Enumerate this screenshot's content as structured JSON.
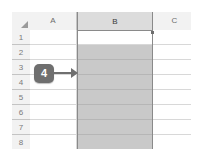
{
  "app": {
    "type": "spreadsheet",
    "name": "Excel worksheet grid"
  },
  "grid": {
    "select_all_corner": "select-all",
    "column_headers": [
      {
        "label": "A",
        "selected": false
      },
      {
        "label": "B",
        "selected": true
      },
      {
        "label": "C",
        "selected": false
      }
    ],
    "row_headers": [
      {
        "label": "1"
      },
      {
        "label": "2"
      },
      {
        "label": "3"
      },
      {
        "label": "4"
      },
      {
        "label": "5"
      },
      {
        "label": "6"
      },
      {
        "label": "7"
      },
      {
        "label": "8"
      }
    ],
    "cells": {
      "A": [
        "",
        "",
        "",
        "",
        "",
        "",
        "",
        ""
      ],
      "B": [
        "",
        "",
        "",
        "",
        "",
        "",
        "",
        ""
      ],
      "C": [
        "",
        "",
        "",
        "",
        "",
        "",
        "",
        ""
      ]
    },
    "active_cell": "B1",
    "selected_column": "B",
    "selected_range": "B1:B8"
  },
  "annotation": {
    "step_number": "4",
    "arrow_direction": "right",
    "points_to": "B"
  },
  "colors": {
    "header_fill": "#f2f2f2",
    "header_selected_fill": "#dcdcdc",
    "selection_shading": "#c9c9c9",
    "selection_border": "#8a8a8a",
    "gridline": "#d8d8d8",
    "callout_fill": "#6f6f6f",
    "callout_text": "#ffffff"
  }
}
